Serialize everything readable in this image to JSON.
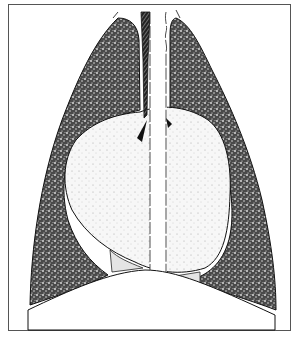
{
  "illustration": {
    "subject": "Chest anatomy: lungs, heart, trachea and esophagus (frontal view)",
    "colors": {
      "border": "#555555",
      "lung_fill": "#5a5a5a",
      "heart_fill": "#f2f2f2",
      "outline": "#111111",
      "background": "#ffffff"
    },
    "parts": [
      {
        "name": "left-lung"
      },
      {
        "name": "right-lung"
      },
      {
        "name": "heart"
      },
      {
        "name": "trachea"
      },
      {
        "name": "esophagus"
      },
      {
        "name": "diaphragm"
      }
    ]
  }
}
